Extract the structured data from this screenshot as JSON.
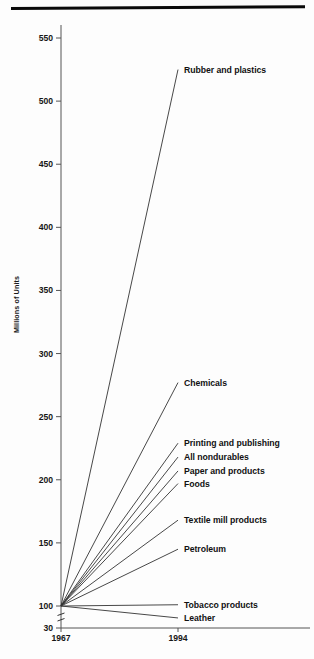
{
  "figure": {
    "ylabel": "Millions of Units",
    "top_rule": "horizontal-rule"
  },
  "chart_data": {
    "type": "line",
    "title": "",
    "subtitle": "",
    "xlabel": "",
    "ylabel": "Millions of Units",
    "x": [
      "1967",
      "1994"
    ],
    "xtick_labels": [
      "1967",
      "1994"
    ],
    "ytick_labels": [
      "30",
      "100",
      "150",
      "200",
      "250",
      "300",
      "350",
      "400",
      "450",
      "500",
      "550"
    ],
    "ytick_values": [
      30,
      100,
      150,
      200,
      250,
      300,
      350,
      400,
      450,
      500,
      550
    ],
    "ylim": [
      30,
      570
    ],
    "y_axis_broken": true,
    "y_break_between": [
      30,
      100
    ],
    "grid": false,
    "legend": "inline-right-endpoint-labels",
    "line_color": "#333333",
    "series": [
      {
        "name": "Rubber and plastics",
        "values": [
          100,
          525
        ]
      },
      {
        "name": "Chemicals",
        "values": [
          100,
          277
        ]
      },
      {
        "name": "Printing and publishing",
        "values": [
          100,
          229
        ]
      },
      {
        "name": "All nondurables",
        "values": [
          100,
          218
        ]
      },
      {
        "name": "Paper and products",
        "values": [
          100,
          207
        ]
      },
      {
        "name": "Foods",
        "values": [
          100,
          197
        ]
      },
      {
        "name": "Textile mill products",
        "values": [
          100,
          168
        ]
      },
      {
        "name": "Petroleum",
        "values": [
          100,
          145
        ]
      },
      {
        "name": "Tobacco products",
        "values": [
          100,
          101
        ]
      },
      {
        "name": "Leather",
        "values": [
          100,
          62
        ]
      }
    ]
  }
}
